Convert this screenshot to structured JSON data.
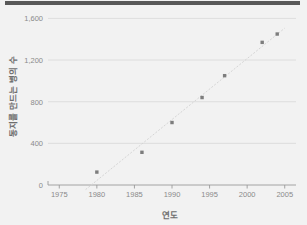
{
  "window": {
    "top_bar_color": "#595959"
  },
  "chart_data": {
    "type": "scatter",
    "title": "",
    "xlabel": "연도",
    "ylabel": "동지를 만드는 병의 수",
    "x": [
      1980,
      1986,
      1990,
      1994,
      1997,
      2002,
      2004
    ],
    "values": [
      124,
      314,
      600,
      840,
      1050,
      1370,
      1450
    ],
    "points": [
      {
        "x": 1980,
        "y": 124
      },
      {
        "x": 1986,
        "y": 314
      },
      {
        "x": 1990,
        "y": 600
      },
      {
        "x": 1994,
        "y": 840
      },
      {
        "x": 1997,
        "y": 1050
      },
      {
        "x": 2002,
        "y": 1370
      },
      {
        "x": 2004,
        "y": 1450
      }
    ],
    "xlim": [
      1973.5,
      2006.5
    ],
    "ylim": [
      0,
      1700
    ],
    "xticks": [
      1975,
      1980,
      1985,
      1990,
      1995,
      2000,
      2005
    ],
    "xtick_labels": [
      "1975",
      "1980",
      "1985",
      "1990",
      "1995",
      "2000",
      "2005"
    ],
    "yticks": [
      0,
      400,
      800,
      1200,
      1600
    ],
    "ytick_labels": [
      "0",
      "400",
      "800",
      "1,200",
      "1,600"
    ],
    "grid": true,
    "legend": null,
    "marker_color": "#7d7d7d",
    "grid_color": "#d8d8d8",
    "background_color": "#f2f2f2",
    "trend_line": true
  }
}
